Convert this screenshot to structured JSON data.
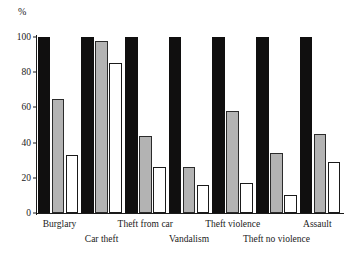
{
  "chart_data": {
    "type": "bar",
    "title": "",
    "subtitle": "",
    "xlabel": "",
    "ylabel": "%",
    "unit_label": "%",
    "ylim": [
      0,
      100
    ],
    "yticks": [
      0,
      20,
      40,
      60,
      80,
      100
    ],
    "ytick_labels": [
      "0",
      "20",
      "40",
      "60",
      "80",
      "100"
    ],
    "grid": false,
    "legend": "none",
    "legend_position": "none",
    "categories": [
      "Burglary",
      "Car theft",
      "Theft from car",
      "Vandalism",
      "Theft violence",
      "Theft no violence",
      "Assault"
    ],
    "category_label_rows": [
      0,
      1,
      0,
      1,
      0,
      1,
      0
    ],
    "series": [
      {
        "name": "series-1",
        "color": "#100f0f",
        "style": "black-filled",
        "values": [
          100,
          100,
          100,
          100,
          100,
          100,
          100
        ]
      },
      {
        "name": "series-2",
        "color": "#b3b3b3",
        "style": "gray-filled",
        "values": [
          65,
          98,
          44,
          26,
          58,
          34,
          45
        ]
      },
      {
        "name": "series-3",
        "color": "#ffffff",
        "style": "white-outlined",
        "values": [
          33,
          85,
          26,
          16,
          17,
          10,
          29
        ]
      }
    ]
  },
  "colors": {
    "series_black": "#100f0f",
    "series_gray": "#b3b3b3",
    "series_white": "#ffffff",
    "axis": "#1a1a1a",
    "background": "#ffffff"
  }
}
